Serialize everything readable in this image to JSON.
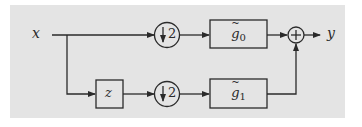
{
  "diagram": {
    "type": "filter-bank-block-diagram",
    "input_label": "x",
    "output_label": "y",
    "delay_block": {
      "label": "z"
    },
    "downsamplers": [
      {
        "label": "↓2",
        "branch": "top"
      },
      {
        "label": "↓2",
        "branch": "bottom"
      }
    ],
    "filters": [
      {
        "base": "g",
        "subscript": "0",
        "accent": "tilde",
        "branch": "top"
      },
      {
        "base": "g",
        "subscript": "1",
        "accent": "tilde",
        "branch": "bottom"
      }
    ],
    "summing_junction": {
      "symbol": "+"
    },
    "colors": {
      "background": "#e4e4e4",
      "stroke": "#2a2a2a"
    }
  }
}
